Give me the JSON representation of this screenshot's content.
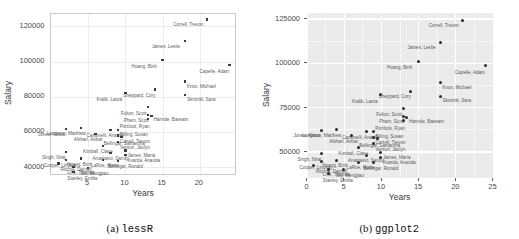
{
  "figure": {
    "panels": [
      {
        "id": "a",
        "caption_prefix": "(a)",
        "caption_name": "lessR"
      },
      {
        "id": "b",
        "caption_prefix": "(b)",
        "caption_name": "ggplot2"
      }
    ]
  },
  "chart_data": [
    {
      "type": "scatter",
      "title": "",
      "subtitle": "",
      "xlabel": "Years",
      "ylabel": "Salary",
      "xlim": [
        0,
        25
      ],
      "ylim": [
        35000,
        127000
      ],
      "xticks": [
        "5",
        "10",
        "15",
        "20"
      ],
      "xtick_values": [
        5,
        10,
        15,
        20
      ],
      "yticks": [
        "40000",
        "60000",
        "80000",
        "100000",
        "120000"
      ],
      "ytick_values": [
        40000,
        60000,
        80000,
        100000,
        120000
      ],
      "grid": true,
      "legend": "none",
      "panel_background": "#ffffff",
      "grid_color": "#ededed",
      "point_color": "#3c3c3c",
      "label_color": "#5c5c5c",
      "points": [
        {
          "label": "Correll, Trevon",
          "x": 21.0,
          "y": 123960,
          "lx": -34,
          "ly": 4
        },
        {
          "label": "James, Leslie",
          "x": 18.0,
          "y": 111500,
          "lx": -33,
          "ly": 4
        },
        {
          "label": "Hoang, Binh",
          "x": 15.0,
          "y": 100920,
          "lx": -31,
          "ly": 5
        },
        {
          "label": "Capelle, Adam",
          "x": 24.0,
          "y": 98200,
          "lx": -30,
          "ly": 5
        },
        {
          "label": "Knox, Michael",
          "x": 18.0,
          "y": 88600,
          "lx": 2,
          "ly": 3
        },
        {
          "label": "Skrotzki, Sara",
          "x": 18.0,
          "y": 81110,
          "lx": 2,
          "ly": 3
        },
        {
          "label": "Sheppard, Cory",
          "x": 14.0,
          "y": 84010,
          "lx": -32,
          "ly": 4
        },
        {
          "label": "Kralik, Laura",
          "x": 10.0,
          "y": 82000,
          "lx": -29,
          "ly": 5
        },
        {
          "label": "Fulton, Scott",
          "x": 13.0,
          "y": 74200,
          "lx": -27,
          "ly": 5
        },
        {
          "label": "Pham, Scott",
          "x": 13.0,
          "y": 69800,
          "lx": -24,
          "ly": 4
        },
        {
          "label": "Hamide, Bassam",
          "x": 13.5,
          "y": 69000,
          "lx": 2,
          "ly": 2
        },
        {
          "label": "Portlock, Ryan",
          "x": 13.0,
          "y": 67340,
          "lx": -28,
          "ly": 6
        },
        {
          "label": "Billing, Susan",
          "x": 9.0,
          "y": 61000,
          "lx": 2,
          "ly": 3
        },
        {
          "label": "Langston, Matthew",
          "x": 4.0,
          "y": 62100,
          "lx": -34,
          "ly": 4
        },
        {
          "label": "Jones, Alissa",
          "x": 2.0,
          "y": 61800,
          "lx": -28,
          "ly": 4
        },
        {
          "label": "Cassinelli, Anastis",
          "x": 8.0,
          "y": 61200,
          "lx": -24,
          "ly": 4
        },
        {
          "label": "Afshari, Anbar",
          "x": 6.0,
          "y": 58800,
          "lx": -22,
          "ly": 4
        },
        {
          "label": "Bellingar, Samantha",
          "x": 9.5,
          "y": 57000,
          "lx": -18,
          "ly": 5
        },
        {
          "label": "Correll, Trevon",
          "x": 9.0,
          "y": 58000,
          "lx": 2,
          "ly": 4
        },
        {
          "label": "Venturi, Jaclyn",
          "x": 9.0,
          "y": 54300,
          "lx": 2,
          "ly": 4
        },
        {
          "label": "Kimball, Claire",
          "x": 7.0,
          "y": 52100,
          "lx": -20,
          "ly": 4
        },
        {
          "label": "Singh, Niraj",
          "x": 2.0,
          "y": 48700,
          "lx": -24,
          "ly": 4
        },
        {
          "label": "James, Maria",
          "x": 10.0,
          "y": 49500,
          "lx": 2,
          "ly": 4
        },
        {
          "label": "Anastasio, Sandy",
          "x": 8.0,
          "y": 47900,
          "lx": -18,
          "ly": 4
        },
        {
          "label": "Kvarda, Ananda",
          "x": 10.0,
          "y": 46800,
          "lx": 2,
          "ly": 4
        },
        {
          "label": "Cooper, Lindsay",
          "x": 2.0,
          "y": 44200,
          "lx": -22,
          "ly": 4
        },
        {
          "label": "Hoang, Binh",
          "x": 4.0,
          "y": 44900,
          "lx": -14,
          "ly": 4
        },
        {
          "label": "LaRoe, Maria",
          "x": 7.0,
          "y": 44000,
          "lx": -12,
          "ly": 4
        },
        {
          "label": "Bellingar, Ronald",
          "x": 9.0,
          "y": 43500,
          "lx": -10,
          "ly": 4
        },
        {
          "label": "Ritchie, Darnell",
          "x": 1.0,
          "y": 42000,
          "lx": 2,
          "ly": 4
        },
        {
          "label": "Link, Thomas",
          "x": 3.0,
          "y": 40000,
          "lx": -6,
          "ly": 4
        },
        {
          "label": "Wu, Mengjiao",
          "x": 5.0,
          "y": 39700,
          "lx": -8,
          "ly": 4
        },
        {
          "label": "Stanley, Emilia",
          "x": 3.0,
          "y": 37400,
          "lx": -6,
          "ly": 5
        }
      ]
    },
    {
      "type": "scatter",
      "title": "",
      "subtitle": "",
      "xlabel": "Years",
      "ylabel": "Salary",
      "xlim": [
        0,
        25
      ],
      "ylim": [
        35000,
        128000
      ],
      "xticks": [
        "0",
        "5",
        "10",
        "15",
        "20",
        "25"
      ],
      "xtick_values": [
        0,
        5,
        10,
        15,
        20,
        25
      ],
      "yticks": [
        "50000",
        "75000",
        "100000",
        "125000"
      ],
      "ytick_values": [
        50000,
        75000,
        100000,
        125000
      ],
      "grid": true,
      "legend": "none",
      "panel_background": "#ebebeb",
      "grid_color": "#ffffff",
      "point_color": "#2b2b2b",
      "label_color": "#585858",
      "points": [
        {
          "label": "Correll, Trevon",
          "x": 21.0,
          "y": 123960,
          "lx": -34,
          "ly": 4
        },
        {
          "label": "James, Leslie",
          "x": 18.0,
          "y": 111500,
          "lx": -33,
          "ly": 4
        },
        {
          "label": "Hoang, Binh",
          "x": 15.0,
          "y": 100920,
          "lx": -31,
          "ly": 5
        },
        {
          "label": "Capelle, Adam",
          "x": 24.0,
          "y": 98200,
          "lx": -30,
          "ly": 5
        },
        {
          "label": "Knox, Michael",
          "x": 18.0,
          "y": 88600,
          "lx": 2,
          "ly": 3
        },
        {
          "label": "Skrotzki, Sara",
          "x": 18.0,
          "y": 81110,
          "lx": 2,
          "ly": 3
        },
        {
          "label": "Sheppard, Cory",
          "x": 14.0,
          "y": 84010,
          "lx": -32,
          "ly": 4
        },
        {
          "label": "Kralik, Laura",
          "x": 10.0,
          "y": 82000,
          "lx": -29,
          "ly": 5
        },
        {
          "label": "Fulton, Scott",
          "x": 13.0,
          "y": 74200,
          "lx": -27,
          "ly": 5
        },
        {
          "label": "Pham, Scott",
          "x": 13.0,
          "y": 69800,
          "lx": -24,
          "ly": 4
        },
        {
          "label": "Hamide, Bassam",
          "x": 13.5,
          "y": 69000,
          "lx": 2,
          "ly": 2
        },
        {
          "label": "Portlock, Ryan",
          "x": 13.0,
          "y": 67340,
          "lx": -28,
          "ly": 6
        },
        {
          "label": "Billing, Susan",
          "x": 9.0,
          "y": 61000,
          "lx": 2,
          "ly": 3
        },
        {
          "label": "Langston, Matthew",
          "x": 4.0,
          "y": 62100,
          "lx": -34,
          "ly": 4
        },
        {
          "label": "Jones, Alissa",
          "x": 2.0,
          "y": 61800,
          "lx": -28,
          "ly": 4
        },
        {
          "label": "Cassinelli, Anastis",
          "x": 8.0,
          "y": 61200,
          "lx": -24,
          "ly": 4
        },
        {
          "label": "Afshari, Anbar",
          "x": 6.0,
          "y": 58800,
          "lx": -22,
          "ly": 4
        },
        {
          "label": "Bellingar, Samantha",
          "x": 9.5,
          "y": 57000,
          "lx": -18,
          "ly": 5
        },
        {
          "label": "Correll, Trevon",
          "x": 9.0,
          "y": 58000,
          "lx": 2,
          "ly": 4
        },
        {
          "label": "Venturi, Jaclyn",
          "x": 9.0,
          "y": 54300,
          "lx": 2,
          "ly": 4
        },
        {
          "label": "Kimball, Claire",
          "x": 7.0,
          "y": 52100,
          "lx": -20,
          "ly": 4
        },
        {
          "label": "Singh, Niraj",
          "x": 2.0,
          "y": 48700,
          "lx": -24,
          "ly": 4
        },
        {
          "label": "James, Maria",
          "x": 10.0,
          "y": 49500,
          "lx": 2,
          "ly": 4
        },
        {
          "label": "Anastasio, Sandy",
          "x": 8.0,
          "y": 47900,
          "lx": -18,
          "ly": 4
        },
        {
          "label": "Kvarda, Ananda",
          "x": 10.0,
          "y": 46800,
          "lx": 2,
          "ly": 4
        },
        {
          "label": "Cooper, Lindsay",
          "x": 2.0,
          "y": 44200,
          "lx": -22,
          "ly": 4
        },
        {
          "label": "Hoang, Binh",
          "x": 4.0,
          "y": 44900,
          "lx": -14,
          "ly": 4
        },
        {
          "label": "LaRoe, Maria",
          "x": 7.0,
          "y": 44000,
          "lx": -12,
          "ly": 4
        },
        {
          "label": "Bellingar, Ronald",
          "x": 9.0,
          "y": 43500,
          "lx": -10,
          "ly": 4
        },
        {
          "label": "Ritchie, Darnell",
          "x": 1.0,
          "y": 42000,
          "lx": 2,
          "ly": 4
        },
        {
          "label": "Link, Thomas",
          "x": 3.0,
          "y": 40000,
          "lx": -6,
          "ly": 4
        },
        {
          "label": "Wu, Mengjiao",
          "x": 5.0,
          "y": 39700,
          "lx": -8,
          "ly": 4
        },
        {
          "label": "Stanley, Emilia",
          "x": 3.0,
          "y": 37400,
          "lx": -6,
          "ly": 5
        }
      ]
    }
  ]
}
